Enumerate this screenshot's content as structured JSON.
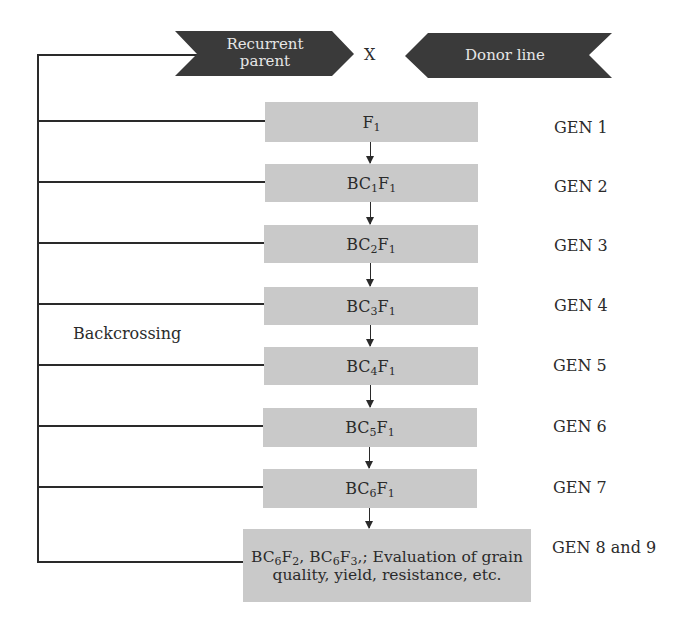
{
  "header": {
    "recurrent_parent": "Recurrent parent",
    "cross_symbol": "X",
    "donor_line": "Donor line"
  },
  "side_label": "Backcrossing",
  "generations": [
    {
      "box": "F1",
      "box_parts": [
        [
          "F",
          ""
        ],
        [
          "",
          "1"
        ]
      ],
      "gen": "GEN 1"
    },
    {
      "box": "BC1F1",
      "gen": "GEN 2"
    },
    {
      "box": "BC2F1",
      "gen": "GEN 3"
    },
    {
      "box": "BC3F1",
      "gen": "GEN 4"
    },
    {
      "box": "BC4F1",
      "gen": "GEN 5"
    },
    {
      "box": "BC5F1",
      "gen": "GEN 6"
    },
    {
      "box": "BC6F1",
      "gen": "GEN 7"
    },
    {
      "box": "BC6F2, BC6F3,; Evaluation of grain quality, yield, resistance, etc.",
      "gen": "GEN 8 and 9"
    }
  ],
  "box_text": {
    "g1": {
      "a": "F",
      "a_sub": "1"
    },
    "g2": {
      "a": "BC",
      "a_sub": "1",
      "b": "F",
      "b_sub": "1"
    },
    "g3": {
      "a": "BC",
      "a_sub": "2",
      "b": "F",
      "b_sub": "1"
    },
    "g4": {
      "a": "BC",
      "a_sub": "3",
      "b": "F",
      "b_sub": "1"
    },
    "g5": {
      "a": "BC",
      "a_sub": "4",
      "b": "F",
      "b_sub": "1"
    },
    "g6": {
      "a": "BC",
      "a_sub": "5",
      "b": "F",
      "b_sub": "1"
    },
    "g7": {
      "a": "BC",
      "a_sub": "6",
      "b": "F",
      "b_sub": "1"
    },
    "g8": {
      "a": "BC",
      "a_sub": "6",
      "b": "F",
      "b_sub": "2",
      "c": ", BC",
      "c_sub": "6",
      "d": "F",
      "d_sub": "3",
      "e": ",; Evaluation of grain quality, yield, resistance, etc."
    }
  },
  "colors": {
    "chevron_fill": "#3a3a3a",
    "box_fill": "#c9c9c9",
    "line": "#2a2a2a"
  }
}
